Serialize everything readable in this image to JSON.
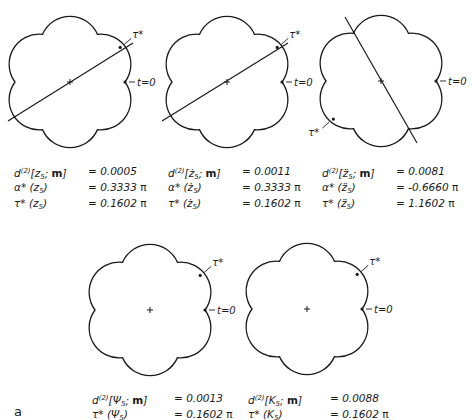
{
  "figure_label": "a",
  "labels": {
    "tau_star": "τ*",
    "t0": "t=0"
  },
  "panels": [
    {
      "id": "z5",
      "symbol": "z",
      "dot": "",
      "center": [
        70,
        82
      ],
      "radius": 58,
      "lobe_radius": 30,
      "axis_line": [
        [
          8,
          121
        ],
        [
          133,
          43
        ]
      ],
      "tau_marker_angle_deg": 30,
      "tau_label_side": "right",
      "stats": [
        {
          "name": "d",
          "sup": "(2)",
          "arg": "z",
          "sub": "5",
          "extra": "m",
          "value": "= 0.0005"
        },
        {
          "name": "α*",
          "arg": "z",
          "sub": "5",
          "value": "= 0.3333",
          "pi": "π"
        },
        {
          "name": "τ*",
          "arg": "z",
          "sub": "5",
          "value": "= 0.1602",
          "pi": "π"
        }
      ]
    },
    {
      "id": "z5_dot",
      "symbol": "ż",
      "center": [
        227,
        82
      ],
      "radius": 58,
      "lobe_radius": 30,
      "axis_line": [
        [
          162,
          121
        ],
        [
          288,
          43
        ]
      ],
      "tau_marker_angle_deg": 30,
      "tau_label_side": "right",
      "stats": [
        {
          "name": "d",
          "sup": "(2)",
          "arg": "ż",
          "sub": "5",
          "extra": "m",
          "value": "= 0.0011"
        },
        {
          "name": "α*",
          "arg": "ż",
          "sub": "5",
          "value": "= 0.3333",
          "pi": "π"
        },
        {
          "name": "τ*",
          "arg": "ż",
          "sub": "5",
          "value": "= 0.1602",
          "pi": "π"
        }
      ]
    },
    {
      "id": "z5_ddot",
      "symbol": "z̈",
      "center": [
        381,
        81
      ],
      "radius": 58,
      "lobe_radius": 30,
      "axis_line": [
        [
          345,
          17
        ],
        [
          417,
          143
        ]
      ],
      "tau_marker_angle_deg": 210,
      "tau_label_side": "left",
      "stats": [
        {
          "name": "d",
          "sup": "(2)",
          "arg": "z̈",
          "sub": "5",
          "extra": "m",
          "value": "=  0.0081"
        },
        {
          "name": "α*",
          "arg": "z̈",
          "sub": "5",
          "value": "= -0.6660",
          "pi": "π"
        },
        {
          "name": "τ*",
          "arg": "z̈",
          "sub": "5",
          "value": "=  1.1602",
          "pi": "π"
        }
      ]
    },
    {
      "id": "psi5",
      "symbol": "Ψ",
      "center": [
        150,
        310
      ],
      "radius": 58,
      "lobe_radius": 30,
      "axis_line": null,
      "tau_marker_angle_deg": 30,
      "tau_label_side": "right",
      "stats": [
        {
          "name": "d",
          "sup": "(2)",
          "arg": "Ψ",
          "sub": "5",
          "extra": "m",
          "value": "= 0.0013"
        },
        {
          "name": "τ*",
          "arg": "Ψ",
          "sub": "5",
          "value": "= 0.1602",
          "pi": "π"
        }
      ]
    },
    {
      "id": "K5",
      "symbol": "K",
      "center": [
        307,
        309
      ],
      "radius": 58,
      "lobe_radius": 30,
      "axis_line": null,
      "tau_marker_angle_deg": 30,
      "tau_label_side": "right",
      "stats": [
        {
          "name": "d",
          "sup": "(2)",
          "arg": "K",
          "sub": "5",
          "extra": "m",
          "value": "= 0.0088"
        },
        {
          "name": "τ*",
          "arg": "K",
          "sub": "5",
          "value": "= 0.1602",
          "pi": "π"
        }
      ]
    }
  ]
}
